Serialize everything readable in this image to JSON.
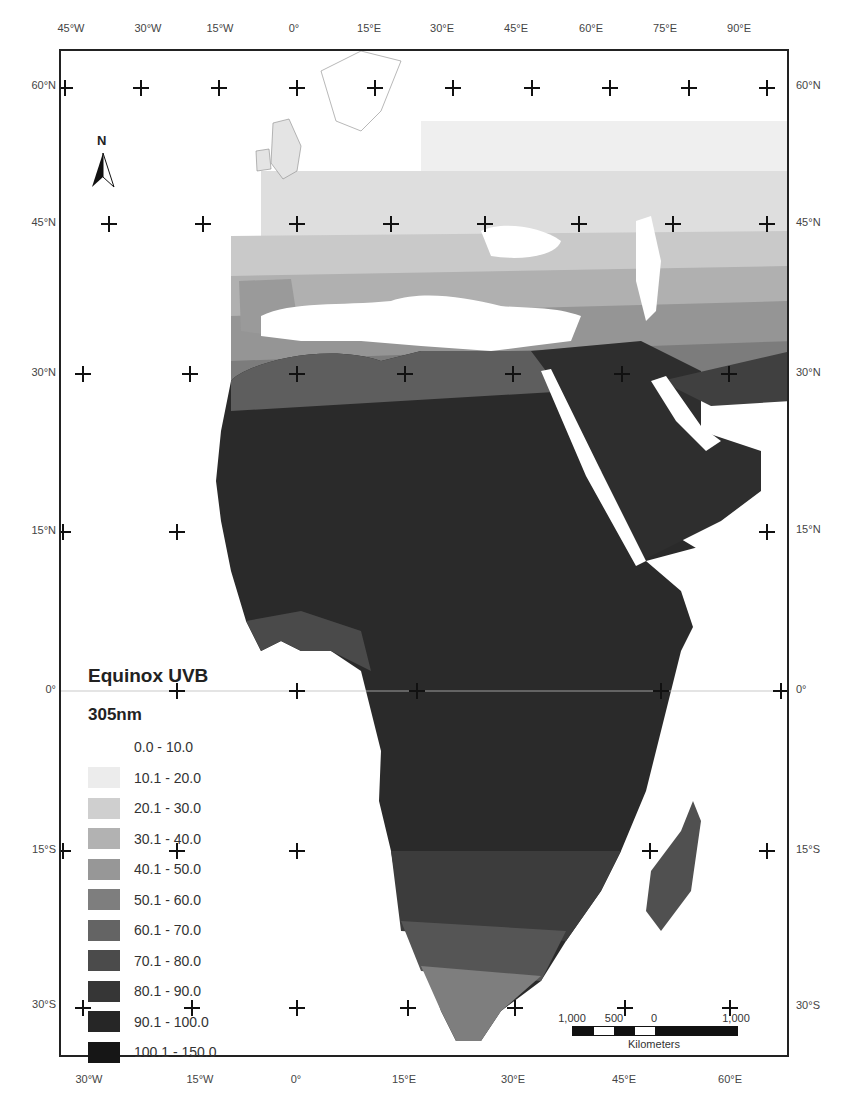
{
  "map": {
    "title": "Equinox UVB",
    "subtitle": "305nm",
    "north_arrow_label": "N",
    "top_axis_labels": [
      "45°W",
      "30°W",
      "15°W",
      "0°",
      "15°E",
      "30°E",
      "45°E",
      "60°E",
      "75°E",
      "90°E"
    ],
    "bottom_axis_labels": [
      "30°W",
      "15°W",
      "0°",
      "15°E",
      "30°E",
      "45°E",
      "60°E"
    ],
    "left_axis_labels": [
      "60°N",
      "45°N",
      "30°N",
      "15°N",
      "0°",
      "15°S",
      "30°S"
    ],
    "right_axis_labels": [
      "60°N",
      "45°N",
      "30°N",
      "15°N",
      "0°",
      "15°S",
      "30°S"
    ],
    "scale_bar": {
      "labels": [
        "1,000",
        "500",
        "0",
        "1,000"
      ],
      "unit": "Kilometers"
    },
    "legend": {
      "items": [
        {
          "label": "0.0 - 10.0",
          "color": "#ffffff"
        },
        {
          "label": "10.1 - 20.0",
          "color": "#ececec"
        },
        {
          "label": "20.1 - 30.0",
          "color": "#cfcfcf"
        },
        {
          "label": "30.1 - 40.0",
          "color": "#b2b2b2"
        },
        {
          "label": "40.1 - 50.0",
          "color": "#979797"
        },
        {
          "label": "50.1 - 60.0",
          "color": "#7e7e7e"
        },
        {
          "label": "60.1 - 70.0",
          "color": "#646464"
        },
        {
          "label": "70.1 - 80.0",
          "color": "#4b4b4b"
        },
        {
          "label": "80.1 - 90.0",
          "color": "#363636"
        },
        {
          "label": "90.1 - 100.0",
          "color": "#262626"
        },
        {
          "label": "100.1 - 150.0",
          "color": "#161616"
        }
      ]
    }
  }
}
